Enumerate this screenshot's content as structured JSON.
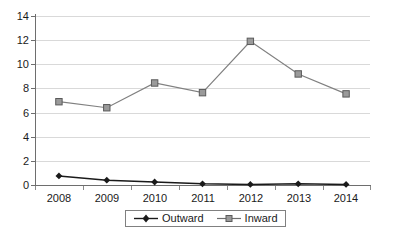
{
  "chart_data": {
    "type": "line",
    "title": "",
    "subtitle": "",
    "xlabel": "",
    "ylabel": "",
    "categories": [
      "2008",
      "2009",
      "2010",
      "2011",
      "2012",
      "2013",
      "2014"
    ],
    "x": [
      2008,
      2009,
      2010,
      2011,
      2012,
      2013,
      2014
    ],
    "series": [
      {
        "name": "Outward",
        "marker": "diamond",
        "color": "#1a1a1a",
        "values": [
          0.75,
          0.4,
          0.25,
          0.1,
          0.05,
          0.1,
          0.05
        ]
      },
      {
        "name": "Inward",
        "marker": "square",
        "color": "#808080",
        "values": [
          6.9,
          6.4,
          8.45,
          7.65,
          11.9,
          9.2,
          7.55
        ]
      }
    ],
    "ylim": [
      0,
      14
    ],
    "yticks": [
      0,
      2,
      4,
      6,
      8,
      10,
      12,
      14
    ],
    "ytick_labels": [
      "0",
      "2",
      "4",
      "6",
      "8",
      "10",
      "12",
      "14"
    ],
    "grid": true,
    "grid_axis": "y",
    "legend_position": "bottom",
    "legend_entries": [
      "Outward",
      "Inward"
    ]
  },
  "legend": {
    "entries": [
      {
        "label": "Outward",
        "marker_icon": "diamond-marker-icon"
      },
      {
        "label": "Inward",
        "marker_icon": "square-marker-icon"
      }
    ]
  },
  "axes": {
    "y_tick_labels": [
      "14",
      "12",
      "10",
      "8",
      "6",
      "4",
      "2",
      "0"
    ],
    "x_tick_labels": [
      "2008",
      "2009",
      "2010",
      "2011",
      "2012",
      "2013",
      "2014"
    ]
  },
  "colors": {
    "outward": "#1a1a1a",
    "inward": "#808080",
    "gridline": "#d9d9d9",
    "axis": "#6e6e6e",
    "background": "#ffffff"
  }
}
